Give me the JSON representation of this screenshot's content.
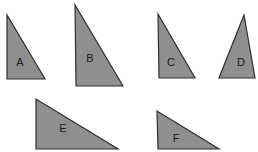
{
  "diagram": {
    "title": "",
    "background": "#ffffff",
    "fill_color": "#8f8f8f",
    "stroke_color": "#2f2f2f",
    "triangles": [
      {
        "label": "A",
        "points": "7,15 7,79 45,79",
        "label_x": 20,
        "label_y": 62
      },
      {
        "label": "B",
        "points": "75,5 76,86 123,86",
        "label_x": 90,
        "label_y": 58
      },
      {
        "label": "C",
        "points": "158,14 159,78 195,78",
        "label_x": 171,
        "label_y": 62
      },
      {
        "label": "D",
        "points": "244,15 219,78 255,78",
        "label_x": 241,
        "label_y": 62
      },
      {
        "label": "E",
        "points": "36,99 36,149 118,149",
        "label_x": 63,
        "label_y": 128
      },
      {
        "label": "F",
        "points": "157,111 158,149 219,149",
        "label_x": 176,
        "label_y": 138
      }
    ]
  }
}
